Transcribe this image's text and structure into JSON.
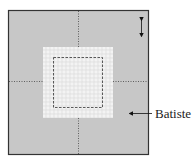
{
  "diagram": {
    "type": "fabric-layout",
    "outer_panel": {
      "fill": "#c7c7c7",
      "border": "#333333"
    },
    "inner_panel": {
      "fill": "#f4f4f4",
      "pattern": "lace"
    },
    "stitch_line": {
      "style": "dashed"
    },
    "fold_lines": {
      "style": "dotted",
      "count": 4
    },
    "dimension_arrow": {
      "direction": "vertical",
      "heads": "both"
    },
    "callout": {
      "label": "Batiste",
      "points_to": "outer_panel"
    }
  }
}
